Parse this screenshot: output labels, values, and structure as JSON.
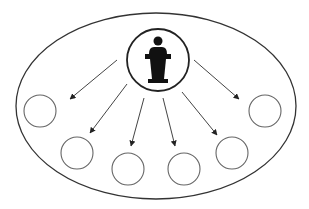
{
  "diagram": {
    "title": "One speaker broadcasting to an audience",
    "colors": {
      "background": "#ffffff",
      "stroke": "#333333",
      "node_stroke": "#666666",
      "icon_fill": "#111111",
      "arrow": "#444444"
    },
    "boundary": {
      "shape": "ellipse",
      "cx": 156,
      "cy": 106,
      "rx": 140,
      "ry": 93
    },
    "center_node": {
      "label": "Speaker at podium",
      "icon": "speaker-podium-icon",
      "cx": 158,
      "cy": 60,
      "r": 31
    },
    "audience_nodes": [
      {
        "id": 1,
        "cx": 40,
        "cy": 111,
        "r": 16
      },
      {
        "id": 2,
        "cx": 77,
        "cy": 153,
        "r": 16
      },
      {
        "id": 3,
        "cx": 128,
        "cy": 169,
        "r": 16
      },
      {
        "id": 4,
        "cx": 184,
        "cy": 169,
        "r": 16
      },
      {
        "id": 5,
        "cx": 232,
        "cy": 153,
        "r": 16
      },
      {
        "id": 6,
        "cx": 265,
        "cy": 111,
        "r": 16
      }
    ],
    "arrows": [
      {
        "from": "center",
        "to": 1,
        "x1": 117,
        "y1": 60,
        "x2": 70,
        "y2": 99
      },
      {
        "from": "center",
        "to": 2,
        "x1": 127,
        "y1": 84,
        "x2": 90,
        "y2": 133
      },
      {
        "from": "center",
        "to": 3,
        "x1": 144,
        "y1": 98,
        "x2": 131,
        "y2": 146
      },
      {
        "from": "center",
        "to": 4,
        "x1": 163,
        "y1": 98,
        "x2": 175,
        "y2": 146
      },
      {
        "from": "center",
        "to": 5,
        "x1": 182,
        "y1": 92,
        "x2": 217,
        "y2": 135
      },
      {
        "from": "center",
        "to": 6,
        "x1": 194,
        "y1": 60,
        "x2": 239,
        "y2": 99
      }
    ]
  }
}
